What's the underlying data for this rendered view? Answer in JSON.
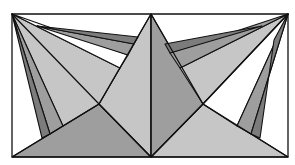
{
  "figure": {
    "title": "",
    "width": 295,
    "height": 165,
    "frame": {
      "x1": 12,
      "y1": 14,
      "x2": 288,
      "y2": 157
    },
    "colors": {
      "background": "#ffffff",
      "light": "#c6c6c6",
      "mid": "#9e9e9e",
      "dark": "#7c7c7c",
      "stroke": "#111111"
    },
    "polygons": [
      {
        "name": "bottom-left-triangle",
        "shade": "mid",
        "points": [
          [
            12,
            157
          ],
          [
            151,
            157
          ],
          [
            99,
            104
          ]
        ]
      },
      {
        "name": "bottom-right-triangle",
        "shade": "light",
        "points": [
          [
            151,
            157
          ],
          [
            288,
            157
          ],
          [
            203,
            104
          ]
        ]
      },
      {
        "name": "center-left-face",
        "shade": "light",
        "points": [
          [
            151,
            14
          ],
          [
            99,
            104
          ],
          [
            151,
            157
          ]
        ]
      },
      {
        "name": "center-right-face",
        "shade": "mid",
        "points": [
          [
            151,
            14
          ],
          [
            203,
            104
          ],
          [
            151,
            157
          ]
        ]
      },
      {
        "name": "upper-left-light-wedge",
        "shade": "light",
        "points": [
          [
            12,
            14
          ],
          [
            120,
            68
          ],
          [
            99,
            104
          ],
          [
            63,
            126
          ]
        ]
      },
      {
        "name": "upper-left-white-wedge",
        "shade": "white",
        "points": [
          [
            12,
            14
          ],
          [
            128,
            55
          ],
          [
            120,
            68
          ]
        ]
      },
      {
        "name": "upper-left-mid-strip",
        "shade": "mid",
        "points": [
          [
            37,
            26
          ],
          [
            134,
            44
          ],
          [
            128,
            55
          ]
        ]
      },
      {
        "name": "upper-left-dark-strip",
        "shade": "dark",
        "points": [
          [
            37,
            26
          ],
          [
            138,
            37
          ],
          [
            134,
            44
          ]
        ]
      },
      {
        "name": "left-mid-strip",
        "shade": "mid",
        "points": [
          [
            12,
            14
          ],
          [
            50,
            134
          ],
          [
            63,
            126
          ]
        ]
      },
      {
        "name": "left-dark-strip",
        "shade": "dark",
        "points": [
          [
            12,
            14
          ],
          [
            42,
            138
          ],
          [
            50,
            134
          ]
        ]
      },
      {
        "name": "upper-right-light-wedge",
        "shade": "light",
        "points": [
          [
            288,
            14
          ],
          [
            180,
            68
          ],
          [
            203,
            104
          ]
        ]
      },
      {
        "name": "upper-right-white-wedge",
        "shade": "white",
        "points": [
          [
            288,
            14
          ],
          [
            203,
            104
          ],
          [
            237,
            126
          ]
        ]
      },
      {
        "name": "upper-right-mid-strip",
        "shade": "mid",
        "points": [
          [
            288,
            14
          ],
          [
            170,
            53
          ],
          [
            180,
            68
          ]
        ]
      },
      {
        "name": "upper-right-dark-strip",
        "shade": "dark",
        "points": [
          [
            262,
            26
          ],
          [
            165,
            44
          ],
          [
            170,
            53
          ]
        ]
      },
      {
        "name": "right-mid-strip",
        "shade": "mid",
        "points": [
          [
            288,
            14
          ],
          [
            237,
            126
          ],
          [
            251,
            134
          ]
        ]
      },
      {
        "name": "right-dark-strip",
        "shade": "dark",
        "points": [
          [
            288,
            14
          ],
          [
            251,
            134
          ],
          [
            260,
            138
          ],
          [
            274,
            40
          ]
        ]
      }
    ],
    "lines": [
      {
        "name": "center-vertical",
        "points": [
          [
            151,
            14
          ],
          [
            151,
            157
          ]
        ]
      },
      {
        "name": "diagonal-left-down",
        "points": [
          [
            151,
            14
          ],
          [
            99,
            104
          ],
          [
            12,
            157
          ]
        ]
      },
      {
        "name": "diagonal-right-down",
        "points": [
          [
            151,
            14
          ],
          [
            203,
            104
          ],
          [
            288,
            157
          ]
        ]
      },
      {
        "name": "diagonal-left-up",
        "points": [
          [
            12,
            14
          ],
          [
            99,
            104
          ],
          [
            151,
            157
          ]
        ]
      },
      {
        "name": "diagonal-right-up",
        "points": [
          [
            288,
            14
          ],
          [
            203,
            104
          ],
          [
            151,
            157
          ]
        ]
      }
    ]
  }
}
